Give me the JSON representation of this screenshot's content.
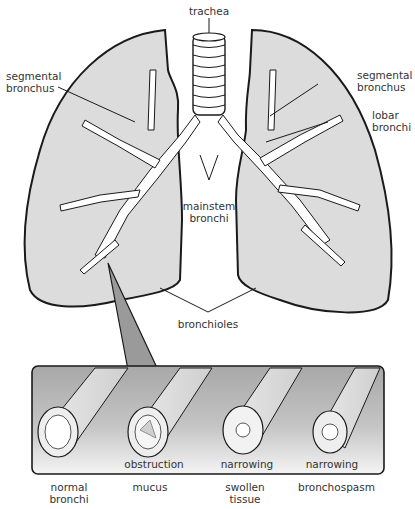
{
  "diagram": {
    "lung_labels": {
      "trachea": "trachea",
      "segmental_bronchus_left": [
        "segmental",
        "bronchus"
      ],
      "segmental_bronchus_right": [
        "segmental",
        "bronchus"
      ],
      "lobar_bronchi": [
        "lobar",
        "bronchi"
      ],
      "mainstem_bronchi": [
        "mainstem",
        "bronchi"
      ],
      "bronchioles": "bronchioles"
    },
    "airway_conditions": [
      {
        "inner_label": "",
        "caption": [
          "normal",
          "bronchi"
        ]
      },
      {
        "inner_label": "obstruction",
        "caption": [
          "mucus",
          ""
        ]
      },
      {
        "inner_label": "narrowing",
        "caption": [
          "swollen",
          "tissue"
        ]
      },
      {
        "inner_label": "narrowing",
        "caption": [
          "bronchospasm",
          ""
        ]
      }
    ],
    "colors": {
      "lung_fill": "#dcdcdc",
      "outline": "#1a1a1a",
      "callout_fill": "#9a9a9a",
      "panel_top": "#a8a8a8",
      "panel_bottom": "#f2f2f2"
    }
  }
}
